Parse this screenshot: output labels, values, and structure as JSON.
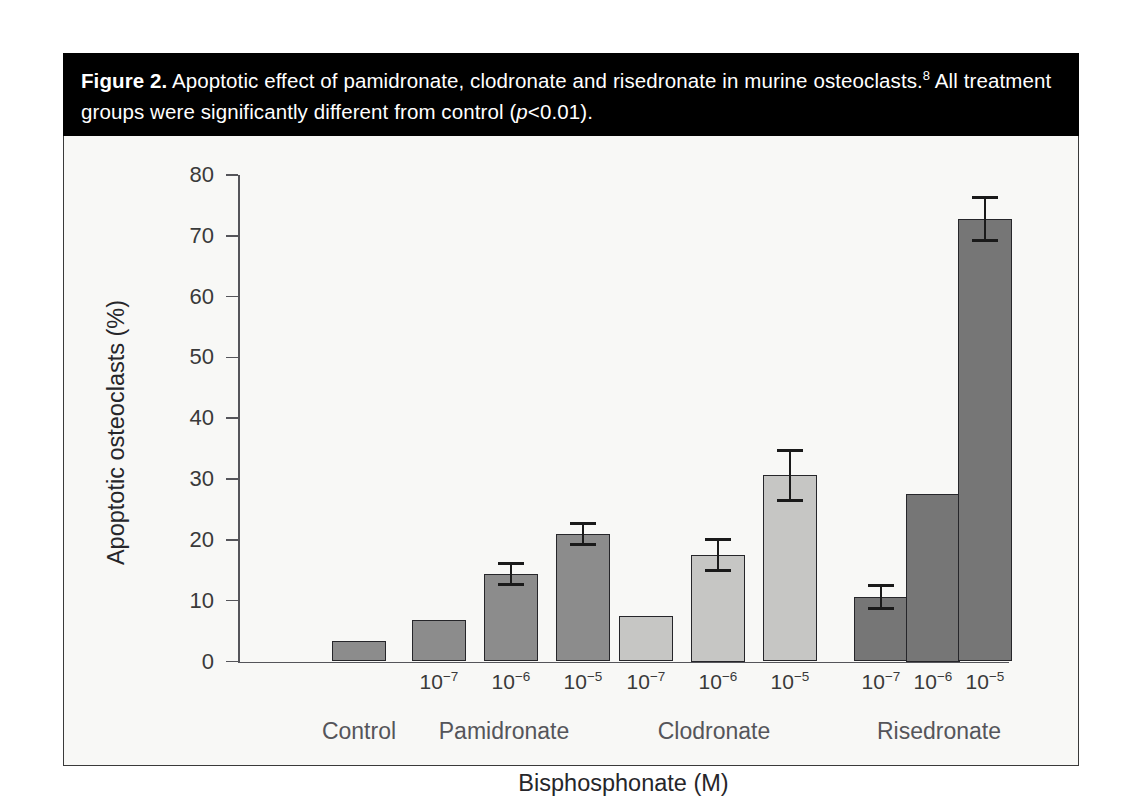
{
  "figure": {
    "label": "Figure 2.",
    "caption_rest_1": " Apoptotic effect of pamidronate, clodronate and risedronate in murine osteoclasts.",
    "caption_superscript": "8",
    "caption_rest_2": " All treatment groups were significantly different from control (",
    "caption_italic": "p",
    "caption_rest_3": "<0.01)."
  },
  "colors": {
    "caption_bg": "#000000",
    "caption_fg": "#ffffff",
    "panel_bg": "#f8f8f6",
    "axis": "#55555a",
    "bar_control": "#8c8c8c",
    "bar_pamidronate": "#8c8c8c",
    "bar_clodronate": "#c6c6c4",
    "bar_risedronate": "#767676",
    "bar_outline": "#26262a",
    "error_bar": "#1a1a1a"
  },
  "chart_data": {
    "type": "bar",
    "title": "Apoptotic effect of pamidronate, clodronate and risedronate in murine osteoclasts",
    "xlabel": "Bisphosphonate (M)",
    "ylabel": "Apoptotic osteoclasts (%)",
    "ylim": [
      0,
      80
    ],
    "ytick_labels": [
      "0",
      "10",
      "20",
      "30",
      "40",
      "50",
      "60",
      "70",
      "80"
    ],
    "ytick_values": [
      0,
      10,
      20,
      30,
      40,
      50,
      60,
      70,
      80
    ],
    "grid": false,
    "legend": "none",
    "groups": [
      {
        "name": "Control",
        "color_key": "bar_control",
        "bars": [
          {
            "tick_mantissa": "",
            "tick_exponent": "",
            "tick_label": "",
            "value": 3.3,
            "error": null
          }
        ]
      },
      {
        "name": "Pamidronate",
        "color_key": "bar_pamidronate",
        "bars": [
          {
            "tick_mantissa": "10",
            "tick_exponent": "−7",
            "tick_label": "10⁻⁷",
            "value": 6.9,
            "error": null
          },
          {
            "tick_mantissa": "10",
            "tick_exponent": "−6",
            "tick_label": "10⁻⁶",
            "value": 14.4,
            "error": 2.0
          },
          {
            "tick_mantissa": "10",
            "tick_exponent": "−5",
            "tick_label": "10⁻⁵",
            "value": 21.0,
            "error": 2.0
          }
        ]
      },
      {
        "name": "Clodronate",
        "color_key": "bar_clodronate",
        "bars": [
          {
            "tick_mantissa": "10",
            "tick_exponent": "−7",
            "tick_label": "10⁻⁷",
            "value": 7.4,
            "error": null
          },
          {
            "tick_mantissa": "10",
            "tick_exponent": "−6",
            "tick_label": "10⁻⁶",
            "value": 17.5,
            "error": 2.8
          },
          {
            "tick_mantissa": "10",
            "tick_exponent": "−5",
            "tick_label": "10⁻⁵",
            "value": 30.6,
            "error": 4.4
          }
        ]
      },
      {
        "name": "Risedronate",
        "color_key": "bar_risedronate",
        "bars": [
          {
            "tick_mantissa": "10",
            "tick_exponent": "−7",
            "tick_label": "10⁻⁷",
            "value": 10.6,
            "error": 2.1
          },
          {
            "tick_mantissa": "10",
            "tick_exponent": "−6",
            "tick_label": "10⁻⁶",
            "value": 27.5,
            "error": null
          },
          {
            "tick_mantissa": "10",
            "tick_exponent": "−5",
            "tick_label": "10⁻⁵",
            "value": 72.7,
            "error": 3.8
          }
        ]
      }
    ]
  }
}
